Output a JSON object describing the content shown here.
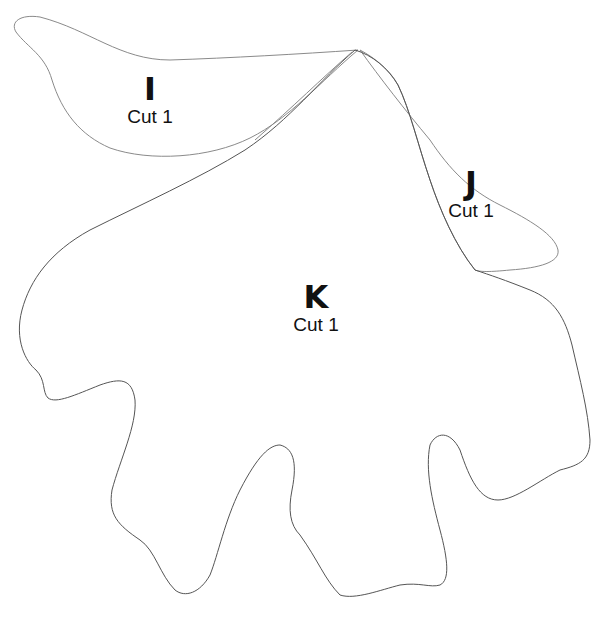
{
  "diagram": {
    "type": "sewing-pattern-pieces",
    "stroke_color": "#8a8a8a",
    "background": "#ffffff",
    "pieces": [
      {
        "id": "I",
        "letter": "I",
        "instruction": "Cut 1"
      },
      {
        "id": "J",
        "letter": "J",
        "instruction": "Cut 1"
      },
      {
        "id": "K",
        "letter": "K",
        "instruction": "Cut 1"
      }
    ]
  }
}
